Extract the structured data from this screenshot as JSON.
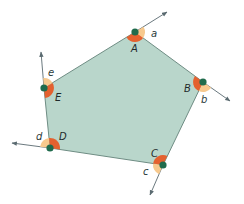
{
  "diagram": {
    "title": "",
    "colors": {
      "polygon_fill": "#b9d6cb",
      "polygon_stroke": "#6f8d84",
      "interior_angle": "#e4612f",
      "exterior_angle": "#f7c98e",
      "vertex_dot": "#1f6b4c",
      "ray": "#5a6a70"
    },
    "vertices": [
      {
        "id": "A",
        "label": "A",
        "x": 135,
        "y": 32
      },
      {
        "id": "B",
        "label": "B",
        "x": 203,
        "y": 82
      },
      {
        "id": "C",
        "label": "C",
        "x": 163,
        "y": 165
      },
      {
        "id": "D",
        "label": "D",
        "x": 50,
        "y": 148
      },
      {
        "id": "E",
        "label": "E",
        "x": 44,
        "y": 88
      }
    ],
    "exterior_angles": [
      {
        "label": "a",
        "vertex": "A"
      },
      {
        "label": "b",
        "vertex": "B"
      },
      {
        "label": "c",
        "vertex": "C"
      },
      {
        "label": "d",
        "vertex": "D"
      },
      {
        "label": "e",
        "vertex": "E"
      }
    ]
  }
}
